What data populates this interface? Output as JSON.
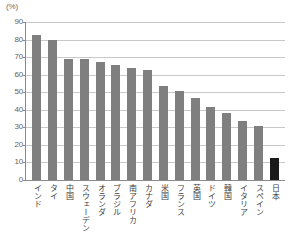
{
  "chart_data": {
    "type": "bar",
    "title": "",
    "subtitle": "",
    "xlabel": "",
    "ylabel": "(%)",
    "unit_label": "(%)",
    "ylim": [
      0,
      90
    ],
    "ytick_step": 10,
    "yticks": [
      0,
      10,
      20,
      30,
      40,
      50,
      60,
      70,
      80,
      90
    ],
    "ytick_labels": [
      "0",
      "10",
      "20",
      "30",
      "40",
      "50",
      "60",
      "70",
      "80",
      "90"
    ],
    "grid": true,
    "legend": "none",
    "categories": [
      "インド",
      "タイ",
      "中国",
      "スウェーデン",
      "オランダ",
      "ブラジル",
      "南アフリカ",
      "カナダ",
      "米国",
      "フランス",
      "英国",
      "ドイツ",
      "韓国",
      "イタリア",
      "スペイン",
      "日本"
    ],
    "values": [
      82.5,
      79.5,
      69.0,
      69.0,
      67.5,
      65.5,
      64.0,
      62.5,
      53.5,
      50.5,
      47.0,
      41.5,
      38.0,
      33.5,
      30.5,
      12.5
    ],
    "highlight_index": 15,
    "colors": {
      "bar": "#7f7f7f",
      "bar_highlight": "#1a1a1a",
      "gridline": "#c9c9c9",
      "axis": "#8a8a8a",
      "label_text": "#3d3d3d",
      "tick_text": "#5f5f5f",
      "background": "#ffffff"
    }
  }
}
